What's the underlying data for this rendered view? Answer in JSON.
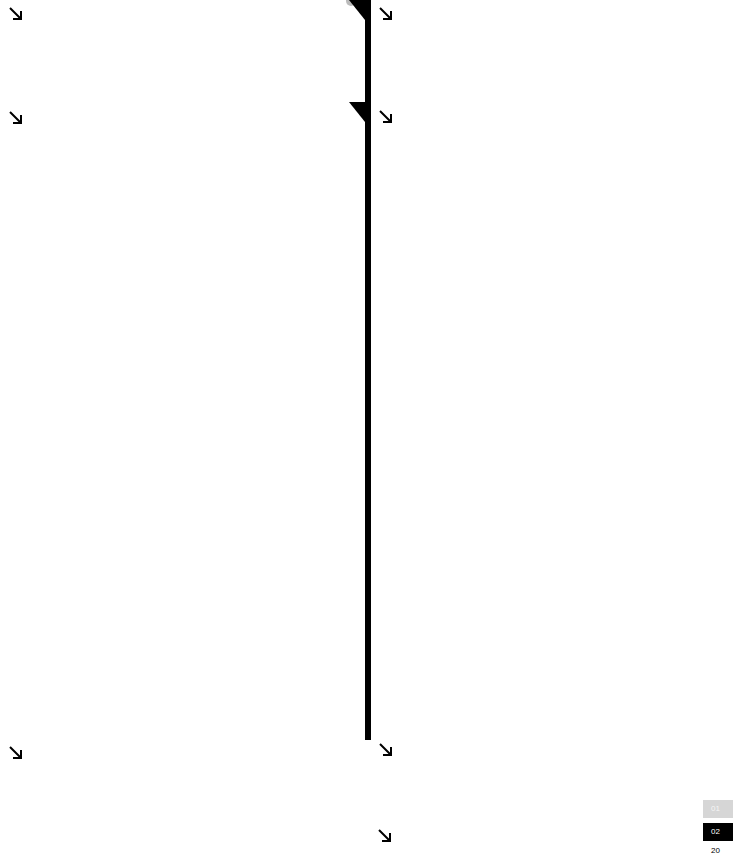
{
  "icons": {
    "arrow": "arrow-down-right-icon"
  },
  "columns": [
    {
      "arrows": [
        "↘",
        "↘",
        "↘"
      ]
    },
    {
      "arrows": [
        "↘",
        "↘",
        "↘",
        "↘"
      ]
    }
  ],
  "pager": {
    "prev_label": "01",
    "current_label": "02"
  },
  "footer": {
    "year_fragment": "20"
  },
  "colors": {
    "background": "#ffffff",
    "line": "#000000",
    "pager_prev": "#d6d6d6",
    "pager_current": "#000000"
  }
}
